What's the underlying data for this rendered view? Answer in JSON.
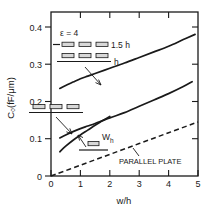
{
  "chart_data": {
    "type": "line",
    "title": "",
    "xlabel": "w/h",
    "ylabel": "C₀(fF/μm)",
    "xlim": [
      0,
      5
    ],
    "ylim": [
      0,
      0.44
    ],
    "grid": false,
    "legend_position": "none",
    "xticks": [
      "0",
      "1",
      "2",
      "3",
      "4",
      "5"
    ],
    "xtick_values": [
      0,
      1,
      2,
      3,
      4,
      5
    ],
    "yticks": [
      "0",
      "0.1",
      "0.2",
      "0.3",
      "0.4"
    ],
    "ytick_values": [
      0,
      0.1,
      0.2,
      0.3,
      0.4
    ],
    "annotations": [
      "ε = 4",
      "1.5 h",
      "h",
      "Wₕ",
      "PARALLEL PLATE"
    ],
    "series": [
      {
        "name": "three coupled lines at 1.5 h spacing",
        "style": "solid",
        "x": [
          0.3,
          0.5,
          0.75,
          1.0,
          1.25,
          1.5,
          2.0,
          2.5,
          3.0,
          3.5,
          4.0,
          4.5,
          4.9
        ],
        "values": [
          0.235,
          0.243,
          0.252,
          0.261,
          0.268,
          0.275,
          0.289,
          0.303,
          0.318,
          0.333,
          0.348,
          0.366,
          0.38
        ]
      },
      {
        "name": "three coupled lines at h spacing",
        "style": "solid",
        "x": [
          0.3,
          0.5,
          0.75,
          1.0,
          1.25,
          1.5,
          2.0,
          2.5,
          3.0,
          3.5,
          4.0,
          4.5,
          4.8
        ],
        "values": [
          0.102,
          0.11,
          0.119,
          0.127,
          0.134,
          0.141,
          0.156,
          0.17,
          0.187,
          0.204,
          0.221,
          0.24,
          0.253
        ]
      },
      {
        "name": "single line over ground plane",
        "style": "solid",
        "x": [
          0.3,
          0.5,
          0.75,
          1.0,
          1.25,
          1.5,
          1.75,
          2.0
        ],
        "values": [
          0.065,
          0.08,
          0.096,
          0.11,
          0.123,
          0.136,
          0.148,
          0.16
        ]
      },
      {
        "name": "PARALLEL PLATE",
        "style": "dashed",
        "x": [
          0.0,
          1.0,
          2.0,
          3.0,
          4.0,
          5.0
        ],
        "values": [
          0.0,
          0.029,
          0.058,
          0.087,
          0.116,
          0.145
        ]
      }
    ]
  },
  "axes": {
    "ylabel": "C₀(fF/μm)",
    "xlabel": "w/h",
    "xticks": [
      "0",
      "1",
      "2",
      "3",
      "4",
      "5"
    ],
    "yticks": [
      "0",
      "0.1",
      "0.2",
      "0.3",
      "0.4"
    ]
  },
  "annotations": {
    "epsilon": "ε = 4",
    "spacing_1_5h": "1.5 h",
    "spacing_h": "h",
    "width_w": "W",
    "width_w_sub": "h",
    "parallel_plate": "PARALLEL PLATE"
  }
}
